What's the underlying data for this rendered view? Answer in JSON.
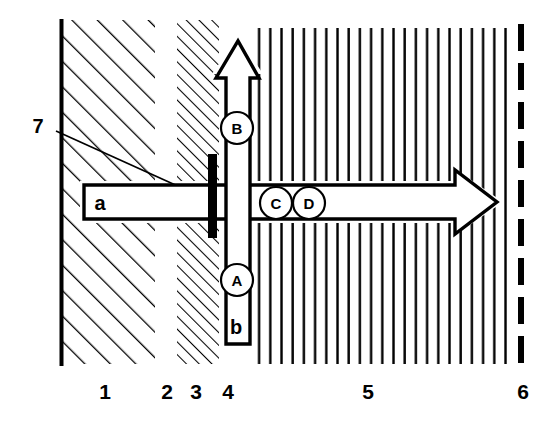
{
  "diagram": {
    "colors": {
      "ink": "#000000",
      "background": "#ffffff"
    },
    "zone_axis": {
      "labels": [
        {
          "text": "1",
          "x": 105,
          "y": 399
        },
        {
          "text": "2",
          "x": 167,
          "y": 399
        },
        {
          "text": "3",
          "x": 196,
          "y": 399
        },
        {
          "text": "4",
          "x": 228,
          "y": 399
        },
        {
          "text": "5",
          "x": 368,
          "y": 399
        },
        {
          "text": "6",
          "x": 523,
          "y": 399
        }
      ]
    },
    "zones": [
      {
        "id": "1",
        "name": "coarse-diagonal-hatch-zone",
        "x0": 60,
        "x1": 155,
        "pattern": "diagonal-hatch-coarse"
      },
      {
        "id": "2",
        "name": "blank-gap-zone",
        "x0": 155,
        "x1": 178,
        "pattern": "none"
      },
      {
        "id": "3",
        "name": "fine-diagonal-hatch-zone",
        "x0": 178,
        "x1": 218,
        "pattern": "diagonal-hatch-fine"
      },
      {
        "id": "4",
        "name": "vertical-arrow-channel-zone",
        "x0": 218,
        "x1": 256,
        "pattern": "none"
      },
      {
        "id": "5",
        "name": "vertical-line-hatch-zone",
        "x0": 256,
        "x1": 512,
        "pattern": "vertical-lines"
      },
      {
        "id": "6",
        "name": "dashed-boundary-zone",
        "x0": 512,
        "x1": 530,
        "pattern": "dashed-line"
      }
    ],
    "flow_arrows": [
      {
        "name": "horizontal-flow-arrow",
        "label": "a",
        "label_x": 100,
        "label_y": 210,
        "direction": "right",
        "body_x0": 84,
        "body_x1": 455,
        "tip_x": 497,
        "top_y": 185,
        "bottom_y": 219,
        "head_top_y": 170,
        "head_bottom_y": 234
      },
      {
        "name": "vertical-flow-arrow",
        "label": "b",
        "label_x": 236,
        "label_y": 333,
        "direction": "up",
        "shaft_x0": 226,
        "shaft_x1": 250,
        "shaft_bottom_y": 344,
        "shaft_top_y": 78,
        "head_left_x": 216,
        "head_right_x": 259,
        "tip_y": 40
      }
    ],
    "markers": [
      {
        "label": "A",
        "cx": 237,
        "cy": 280,
        "r": 16,
        "name": "marker-a"
      },
      {
        "label": "B",
        "cx": 237,
        "cy": 128,
        "r": 16,
        "name": "marker-b"
      },
      {
        "label": "C",
        "cx": 276,
        "cy": 203,
        "r": 16,
        "name": "marker-c"
      },
      {
        "label": "D",
        "cx": 309,
        "cy": 203,
        "r": 16,
        "name": "marker-d"
      }
    ],
    "callout": {
      "label": "7",
      "label_x": 38,
      "label_y": 133,
      "leader_x0": 56,
      "leader_y0": 131,
      "leader_x1": 212,
      "leader_y1": 201,
      "target_name": "thick-black-bar"
    },
    "thick_bar": {
      "name": "thick-black-bar",
      "x": 208,
      "y": 154,
      "width": 9,
      "height": 84
    }
  }
}
